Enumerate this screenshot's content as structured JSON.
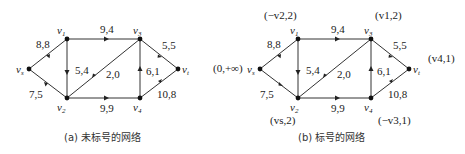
{
  "graphs": [
    {
      "id": "a",
      "caption": "(a) 未标号的网络",
      "nodes": [
        {
          "id": "vs",
          "label": "vs",
          "x": 29,
          "y": 69
        },
        {
          "id": "v1",
          "label": "v1",
          "x": 67,
          "y": 39
        },
        {
          "id": "v2",
          "label": "v2",
          "x": 67,
          "y": 98
        },
        {
          "id": "v3",
          "label": "v3",
          "x": 140,
          "y": 39
        },
        {
          "id": "v4",
          "label": "v4",
          "x": 140,
          "y": 98
        },
        {
          "id": "vt",
          "label": "vt",
          "x": 178,
          "y": 69
        }
      ],
      "edges": [
        {
          "from": "vs",
          "to": "v1",
          "label": "8,8"
        },
        {
          "from": "vs",
          "to": "v2",
          "label": "7,5"
        },
        {
          "from": "v1",
          "to": "v3",
          "label": "9,4"
        },
        {
          "from": "v1",
          "to": "v2",
          "label": "5,4"
        },
        {
          "from": "v3",
          "to": "v2",
          "label": "2,0"
        },
        {
          "from": "v2",
          "to": "v4",
          "label": "9,9"
        },
        {
          "from": "v4",
          "to": "v3",
          "label": "6,1"
        },
        {
          "from": "v3",
          "to": "vt",
          "label": "5,5"
        },
        {
          "from": "v4",
          "to": "vt",
          "label": "10,8"
        }
      ],
      "node_marks": []
    },
    {
      "id": "b",
      "caption": "(b) 标号的网络",
      "nodes": [
        {
          "id": "vs",
          "label": "vs",
          "x": 260,
          "y": 69
        },
        {
          "id": "v1",
          "label": "v1",
          "x": 298,
          "y": 39
        },
        {
          "id": "v2",
          "label": "v2",
          "x": 298,
          "y": 98
        },
        {
          "id": "v3",
          "label": "v3",
          "x": 371,
          "y": 39
        },
        {
          "id": "v4",
          "label": "v4",
          "x": 371,
          "y": 98
        },
        {
          "id": "vt",
          "label": "vt",
          "x": 409,
          "y": 69
        }
      ],
      "edges": [
        {
          "from": "vs",
          "to": "v1",
          "label": "8,8"
        },
        {
          "from": "vs",
          "to": "v2",
          "label": "7,5"
        },
        {
          "from": "v1",
          "to": "v3",
          "label": "9,4"
        },
        {
          "from": "v1",
          "to": "v2",
          "label": "5,4"
        },
        {
          "from": "v3",
          "to": "v2",
          "label": "2,0"
        },
        {
          "from": "v2",
          "to": "v4",
          "label": "9,9"
        },
        {
          "from": "v4",
          "to": "v3",
          "label": "6,1"
        },
        {
          "from": "v3",
          "to": "vt",
          "label": "5,5"
        },
        {
          "from": "v4",
          "to": "vt",
          "label": "10,8"
        }
      ],
      "node_marks": [
        {
          "node": "vs",
          "text": "(0,+∞)"
        },
        {
          "node": "v1",
          "text": "(−v2,2)"
        },
        {
          "node": "v3",
          "text": "(v1,2)"
        },
        {
          "node": "v2",
          "text": "(vs,2)"
        },
        {
          "node": "v4",
          "text": "(−v3,1)"
        },
        {
          "node": "vt",
          "text": "(v4,1)"
        }
      ]
    }
  ]
}
